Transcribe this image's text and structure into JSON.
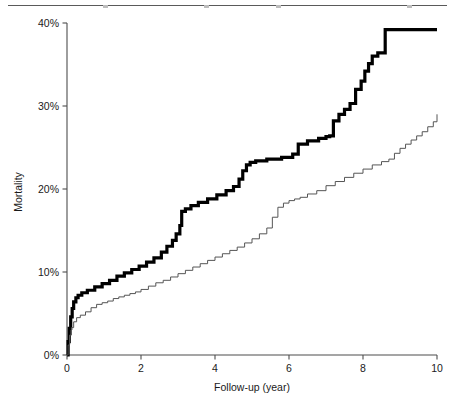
{
  "figure": {
    "top_rule": true,
    "background_color": "#ffffff"
  },
  "chart_data": {
    "type": "line",
    "title": "",
    "subtitle": "",
    "xlabel": "Follow-up (year)",
    "ylabel": "Mortality",
    "xlim": [
      0,
      10
    ],
    "ylim": [
      0,
      40
    ],
    "grid": false,
    "legend": "none",
    "xticks": [
      0,
      2,
      4,
      6,
      8,
      10
    ],
    "xtick_labels": [
      "0",
      "2",
      "4",
      "6",
      "8",
      "10"
    ],
    "yticks": [
      0,
      10,
      20,
      30,
      40
    ],
    "ytick_labels": [
      "0%",
      "10%",
      "20%",
      "30%",
      "40%"
    ],
    "y_units": "percent",
    "step_style": "post",
    "series": [
      {
        "name": "bold-curve",
        "color": "#000000",
        "line_width": 3.2,
        "x": [
          0.0,
          0.03,
          0.06,
          0.1,
          0.14,
          0.18,
          0.24,
          0.3,
          0.4,
          0.55,
          0.75,
          0.95,
          1.15,
          1.35,
          1.55,
          1.75,
          1.95,
          2.15,
          2.35,
          2.55,
          2.7,
          2.85,
          2.95,
          3.05,
          3.1,
          3.2,
          3.35,
          3.55,
          3.8,
          4.05,
          4.3,
          4.5,
          4.65,
          4.75,
          4.85,
          4.95,
          5.1,
          5.4,
          5.8,
          6.1,
          6.25,
          6.5,
          6.8,
          7.0,
          7.1,
          7.2,
          7.35,
          7.5,
          7.65,
          7.8,
          7.95,
          8.05,
          8.15,
          8.25,
          8.4,
          8.6,
          9.2,
          10.0
        ],
        "y": [
          0.0,
          1.6,
          3.2,
          4.6,
          5.6,
          6.4,
          6.9,
          7.2,
          7.5,
          7.8,
          8.2,
          8.6,
          9.0,
          9.5,
          9.9,
          10.3,
          10.7,
          11.2,
          11.7,
          12.4,
          13.1,
          13.8,
          14.6,
          15.6,
          17.3,
          17.6,
          18.0,
          18.4,
          18.8,
          19.3,
          19.8,
          20.3,
          21.2,
          22.2,
          22.9,
          23.2,
          23.4,
          23.6,
          23.8,
          24.2,
          25.4,
          25.8,
          26.1,
          26.3,
          26.4,
          28.2,
          29.0,
          29.6,
          30.3,
          32.0,
          33.0,
          34.2,
          35.1,
          36.0,
          36.4,
          39.2,
          39.2,
          39.2
        ]
      },
      {
        "name": "thin-curve",
        "color": "#555555",
        "line_width": 1.0,
        "x": [
          0.0,
          0.03,
          0.07,
          0.12,
          0.18,
          0.26,
          0.36,
          0.5,
          0.65,
          0.8,
          0.95,
          1.1,
          1.25,
          1.4,
          1.55,
          1.7,
          1.85,
          2.0,
          2.2,
          2.4,
          2.6,
          2.8,
          3.0,
          3.2,
          3.4,
          3.6,
          3.8,
          4.0,
          4.2,
          4.4,
          4.6,
          4.8,
          5.0,
          5.2,
          5.4,
          5.55,
          5.7,
          5.85,
          6.0,
          6.15,
          6.3,
          6.5,
          6.75,
          7.0,
          7.25,
          7.5,
          7.75,
          8.0,
          8.25,
          8.5,
          8.7,
          8.85,
          9.0,
          9.15,
          9.3,
          9.45,
          9.6,
          9.75,
          9.9,
          10.0
        ],
        "y": [
          0.0,
          1.2,
          2.4,
          3.3,
          4.0,
          4.5,
          4.8,
          5.2,
          5.7,
          6.1,
          6.3,
          6.5,
          6.8,
          7.0,
          7.2,
          7.4,
          7.6,
          7.9,
          8.3,
          8.7,
          9.0,
          9.4,
          9.8,
          10.2,
          10.6,
          11.0,
          11.4,
          11.8,
          12.2,
          12.6,
          13.0,
          13.5,
          14.0,
          14.6,
          15.3,
          16.6,
          17.8,
          18.3,
          18.6,
          18.8,
          19.0,
          19.4,
          19.8,
          20.4,
          20.9,
          21.4,
          21.9,
          22.4,
          22.9,
          23.3,
          23.6,
          24.3,
          24.9,
          25.4,
          25.9,
          26.4,
          26.9,
          27.5,
          28.1,
          29.0
        ]
      }
    ]
  }
}
